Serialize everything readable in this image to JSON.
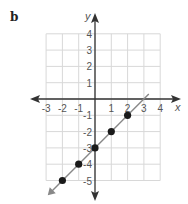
{
  "figure": {
    "label": "b"
  },
  "chart_data": {
    "type": "line",
    "title": "",
    "xlabel": "x",
    "ylabel": "y",
    "xlim": [
      -3,
      4
    ],
    "ylim": [
      -5,
      4
    ],
    "grid": true,
    "x_ticks": [
      "-3",
      "-2",
      "-1",
      "1",
      "2",
      "3",
      "4"
    ],
    "y_ticks": [
      "4",
      "3",
      "2",
      "1",
      "-1",
      "-2",
      "-3",
      "-4",
      "-5"
    ],
    "series": [
      {
        "name": "line y = x - 3",
        "equation": "y = x - 3",
        "points": [
          {
            "x": -2,
            "y": -5
          },
          {
            "x": -1,
            "y": -4
          },
          {
            "x": 0,
            "y": -3
          },
          {
            "x": 1,
            "y": -2
          },
          {
            "x": 2,
            "y": -1
          }
        ]
      }
    ]
  },
  "colors": {
    "grid": "#d8d8d8",
    "axis": "#333333",
    "line": "#888888",
    "point": "#1a1a1a"
  }
}
